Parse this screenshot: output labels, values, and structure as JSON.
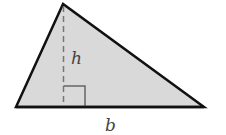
{
  "diagram": {
    "type": "triangle-area",
    "labels": {
      "height": "h",
      "base": "b"
    },
    "colors": {
      "fill": "#d9d9d9",
      "stroke": "#111111",
      "dash": "#777777",
      "text": "#444444"
    },
    "vertices": {
      "apex": [
        63,
        4
      ],
      "bottom_left": [
        16,
        107
      ],
      "bottom_right": [
        204,
        107
      ]
    }
  }
}
